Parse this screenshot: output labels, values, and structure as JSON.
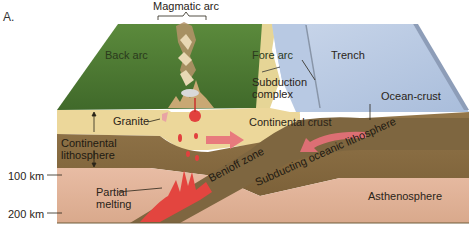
{
  "panel_label": "A.",
  "labels": {
    "magmatic_arc": "Magmatic arc",
    "back_arc": "Back arc",
    "fore_arc": "Fore arc",
    "trench": "Trench",
    "subduction_complex_line1": "Subduction",
    "subduction_complex_line2": "complex",
    "ocean_crust": "Ocean-crust",
    "granite": "Granite",
    "continental_crust": "Continental crust",
    "continental_lithosphere_line1": "Continental",
    "continental_lithosphere_line2": "lithosphere",
    "benioff_zone": "Benioff zone",
    "subducting_oceanic_lithosphere": "Subducting oceanic lithosphere",
    "partial_melting_line1": "Partial",
    "partial_melting_line2": "melting",
    "asthenosphere": "Asthenosphere"
  },
  "depth_scale": [
    {
      "label": "100 km"
    },
    {
      "label": "200 km"
    }
  ],
  "colors": {
    "land_green": "#4f7a34",
    "ocean_blue": "#b7c8e2",
    "crust_tan": "#ecd79a",
    "lithosphere_brown": "#8a6e42",
    "asthenosphere_pink": "#e2b49a",
    "magma_red": "#e2403e",
    "arrow_pink": "#e8707a"
  }
}
